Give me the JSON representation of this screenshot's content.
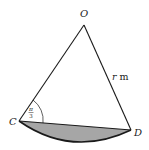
{
  "diagram": {
    "points": {
      "O": {
        "label": "O",
        "x": 84,
        "y": 25
      },
      "C": {
        "label": "C",
        "x": 19,
        "y": 121
      },
      "D": {
        "label": "D",
        "x": 131,
        "y": 130
      }
    },
    "side_label": {
      "var": "r",
      "unit": " m"
    },
    "angle_label": {
      "numerator": "π",
      "denominator": "3"
    },
    "colors": {
      "stroke": "#1a1a1a",
      "shade": "#a6a6a6",
      "background": "#ffffff"
    }
  }
}
